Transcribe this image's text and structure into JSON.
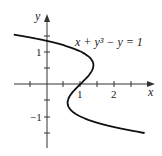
{
  "chart_data": {
    "type": "line",
    "title": "",
    "equation_label": "x + y³ − y = 1",
    "xlabel": "x",
    "ylabel": "y",
    "x_tick_labels": [
      "1",
      "2"
    ],
    "y_tick_labels": [
      "1",
      "−1"
    ],
    "xlim": [
      -1,
      3.6
    ],
    "ylim": [
      -1.9,
      2.0
    ],
    "grid": false,
    "series": [
      {
        "name": "x + y^3 - y = 1",
        "description": "x = 1 + y - y^3",
        "points": [
          {
            "x": -0.875,
            "y": 1.5
          },
          {
            "x": 0.0,
            "y": 1.325
          },
          {
            "x": 0.76,
            "y": 1.2
          },
          {
            "x": 1.0,
            "y": 1.0
          },
          {
            "x": 1.385,
            "y": 0.577
          },
          {
            "x": 1.0,
            "y": 0.0
          },
          {
            "x": 0.615,
            "y": -0.577
          },
          {
            "x": 1.0,
            "y": -1.0
          },
          {
            "x": 2.0,
            "y": -1.325
          },
          {
            "x": 3.496,
            "y": -1.6
          }
        ]
      }
    ],
    "color": "#111111"
  }
}
